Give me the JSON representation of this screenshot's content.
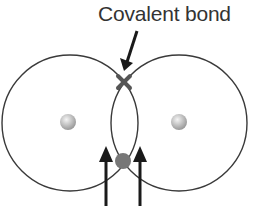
{
  "diagram": {
    "label": "Covalent bond",
    "colors": {
      "shell": "#3a3a3a",
      "arrow": "#1a1a1a",
      "bond_mark": "#555555",
      "shared_electron": "#777777",
      "nucleus_light": "#f2f2f2",
      "nucleus_dark": "#9a9a9a",
      "text": "#333333"
    },
    "atoms": [
      {
        "name": "left-atom",
        "shell_center": [
          70,
          123
        ],
        "shell_radius": 68,
        "nucleus_center": [
          68,
          122
        ],
        "nucleus_radius": 8
      },
      {
        "name": "right-atom",
        "shell_center": [
          179,
          123
        ],
        "shell_radius": 68,
        "nucleus_center": [
          179,
          122
        ],
        "nucleus_radius": 8
      }
    ],
    "bond_mark_position": [
      124,
      82
    ],
    "shared_electron_position": [
      123,
      161
    ],
    "pointer_arrow": {
      "from": [
        137,
        31
      ],
      "to": [
        125,
        70
      ]
    },
    "spin_arrows": [
      {
        "x": 106,
        "y_bottom": 206,
        "y_top": 148
      },
      {
        "x": 140,
        "y_bottom": 206,
        "y_top": 148
      }
    ]
  }
}
